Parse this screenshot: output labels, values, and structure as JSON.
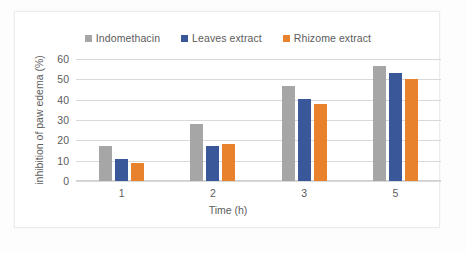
{
  "chart_data": {
    "type": "bar",
    "title": "",
    "xlabel": "Time (h)",
    "ylabel": "inhibition of paw edema (%)",
    "categories": [
      "1",
      "2",
      "3",
      "5"
    ],
    "yticks": [
      "60",
      "50",
      "40",
      "30",
      "20",
      "10",
      "0"
    ],
    "ylim": [
      0,
      60
    ],
    "grid": true,
    "legend_position": "top-center",
    "series": [
      {
        "name": "Indomethacin",
        "color": "#a6a6a6",
        "values": [
          17,
          28,
          46.5,
          56.5
        ]
      },
      {
        "name": "Leaves extract",
        "color": "#3a5899",
        "values": [
          11,
          17,
          40.5,
          53
        ]
      },
      {
        "name": "Rhizome extract",
        "color": "#e8822c",
        "values": [
          9,
          18,
          38,
          50
        ]
      }
    ]
  }
}
